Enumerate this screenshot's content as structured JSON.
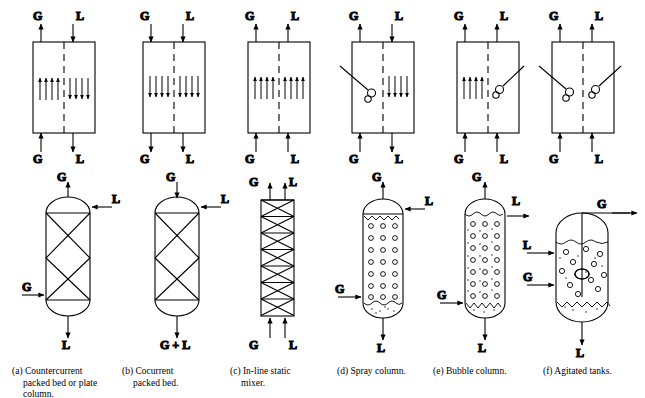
{
  "figure": {
    "stroke_color": "#000000",
    "background_color": "#ffffff",
    "labels": {
      "gas": "G",
      "liquid": "L",
      "gas_plus_liquid": "G + L"
    }
  },
  "captions": [
    {
      "id": "a",
      "line1": "(a) Countercurrent",
      "line2": "packed bed or plate",
      "line3": "column."
    },
    {
      "id": "b",
      "line1": "(b) Cocurrent",
      "line2": "packed bed.",
      "line3": ""
    },
    {
      "id": "c",
      "line1": "(c) In-line static",
      "line2": "mixer.",
      "line3": ""
    },
    {
      "id": "d",
      "line1": "(d) Spray column.",
      "line2": "",
      "line3": ""
    },
    {
      "id": "e",
      "line1": "(e) Bubble column.",
      "line2": "",
      "line3": ""
    },
    {
      "id": "f",
      "line1": "(f) Agitated tanks.",
      "line2": "",
      "line3": ""
    }
  ],
  "top_row": [
    {
      "id": "a",
      "name": "countercurrent-flow-box",
      "inlets_top": [
        "G",
        "L"
      ],
      "inlets_bottom": [
        "G",
        "L"
      ],
      "gas_direction": "up",
      "liquid_direction": "down"
    },
    {
      "id": "b",
      "name": "cocurrent-downflow-box",
      "inlets_top": [
        "G",
        "L"
      ],
      "inlets_bottom": [
        "G",
        "L"
      ],
      "gas_direction": "down",
      "liquid_direction": "down"
    },
    {
      "id": "c",
      "name": "cocurrent-upflow-box",
      "inlets_top": [
        "G",
        "L"
      ],
      "inlets_bottom": [
        "G",
        "L"
      ],
      "gas_direction": "up",
      "liquid_direction": "up"
    },
    {
      "id": "d",
      "name": "spray-flow-box",
      "inlets_top": [
        "G",
        "L"
      ],
      "inlets_bottom": [
        "G",
        "L"
      ],
      "gas_direction": "up",
      "liquid_direction": "down"
    },
    {
      "id": "e",
      "name": "bubble-flow-box",
      "inlets_top": [
        "G",
        "L"
      ],
      "inlets_bottom": [
        "G",
        "L"
      ],
      "gas_direction": "up",
      "liquid_direction": "up"
    },
    {
      "id": "f",
      "name": "agitated-flow-box",
      "inlets_top": [
        "G",
        "L"
      ],
      "inlets_bottom": [
        "G",
        "L"
      ],
      "gas_direction": "up",
      "liquid_direction": "up"
    }
  ],
  "bottom_row": [
    {
      "id": "a",
      "name": "countercurrent-packed-column",
      "top_outlet": "G",
      "side_inlet_top": "L",
      "side_inlet_bottom": "G",
      "bottom_outlet": "L",
      "packing_sections": 2
    },
    {
      "id": "b",
      "name": "cocurrent-packed-column",
      "top_inlet": "G",
      "side_inlet_top": "L",
      "bottom_outlet": "G + L",
      "packing_sections": 2
    },
    {
      "id": "c",
      "name": "in-line-static-mixer",
      "top_outlets": [
        "G",
        "L"
      ],
      "bottom_inlets": [
        "G",
        "L"
      ],
      "mixer_elements": 7
    },
    {
      "id": "d",
      "name": "spray-column",
      "top_outlet": "G",
      "side_inlet_top": "L",
      "side_inlet_bottom": "G",
      "bottom_outlet": "L",
      "droplet_rows": 7,
      "droplet_cols": 3
    },
    {
      "id": "e",
      "name": "bubble-column",
      "top_outlet": "G",
      "side_outlet_top": "L",
      "side_inlet_bottom": "G",
      "bottom_outlet": "L",
      "bubble_rows": 7,
      "bubble_cols": 3
    },
    {
      "id": "f",
      "name": "agitated-tank",
      "side_outlet_top": "G",
      "side_inlet_liquid": "L",
      "side_inlet_gas": "G",
      "bottom_outlet": "L",
      "impeller": true
    }
  ]
}
